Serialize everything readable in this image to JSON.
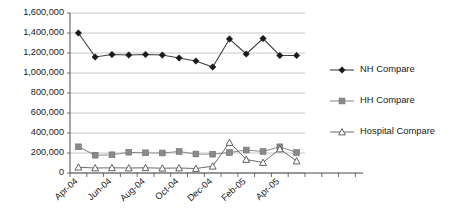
{
  "chart_data": {
    "type": "line",
    "title": "",
    "subtitle": "",
    "xlabel": "",
    "ylabel": "",
    "grid": true,
    "legend_position": "right",
    "ylim": [
      0,
      1600000
    ],
    "ytick_labels": [
      "1,600,000",
      "1,400,000",
      "1,200,000",
      "1,000,000",
      "800,000",
      "600,000",
      "400,000",
      "200,000",
      "0"
    ],
    "ytick_values": [
      1600000,
      1400000,
      1200000,
      1000000,
      800000,
      600000,
      400000,
      200000,
      0
    ],
    "categories": [
      "Apr-04",
      "May-04",
      "Jun-04",
      "Jul-04",
      "Aug-04",
      "Sep-04",
      "Oct-04",
      "Nov-04",
      "Dec-04",
      "Jan-05",
      "Feb-05",
      "Mar-05",
      "Apr-05",
      "May-05"
    ],
    "xtick_labels_shown": [
      "Apr-04",
      "Jun-04",
      "Aug-04",
      "Oct-04",
      "Dec-04",
      "Feb-05",
      "Apr-05"
    ],
    "series": [
      {
        "name": "NH Compare",
        "marker": "diamond-filled",
        "color": "#1a1a1a",
        "values": [
          1400000,
          1160000,
          1185000,
          1180000,
          1185000,
          1180000,
          1150000,
          1120000,
          1060000,
          1340000,
          1190000,
          1345000,
          1175000,
          1175000
        ]
      },
      {
        "name": "HH Compare",
        "marker": "square-filled",
        "color": "#8a8a8a",
        "values": [
          262000,
          178000,
          182000,
          208000,
          202000,
          200000,
          215000,
          190000,
          188000,
          205000,
          230000,
          215000,
          262000,
          205000
        ]
      },
      {
        "name": "Hospital Compare",
        "marker": "triangle-open",
        "color": "#4f4f4f",
        "values": [
          58000,
          50000,
          52000,
          50000,
          52000,
          48000,
          50000,
          45000,
          68000,
          305000,
          135000,
          105000,
          240000,
          120000
        ]
      }
    ]
  },
  "legend": {
    "items": [
      {
        "label": "NH Compare",
        "marker": "diamond-filled"
      },
      {
        "label": "HH Compare",
        "marker": "square-filled"
      },
      {
        "label": "Hospital Compare",
        "marker": "triangle-open"
      }
    ]
  }
}
